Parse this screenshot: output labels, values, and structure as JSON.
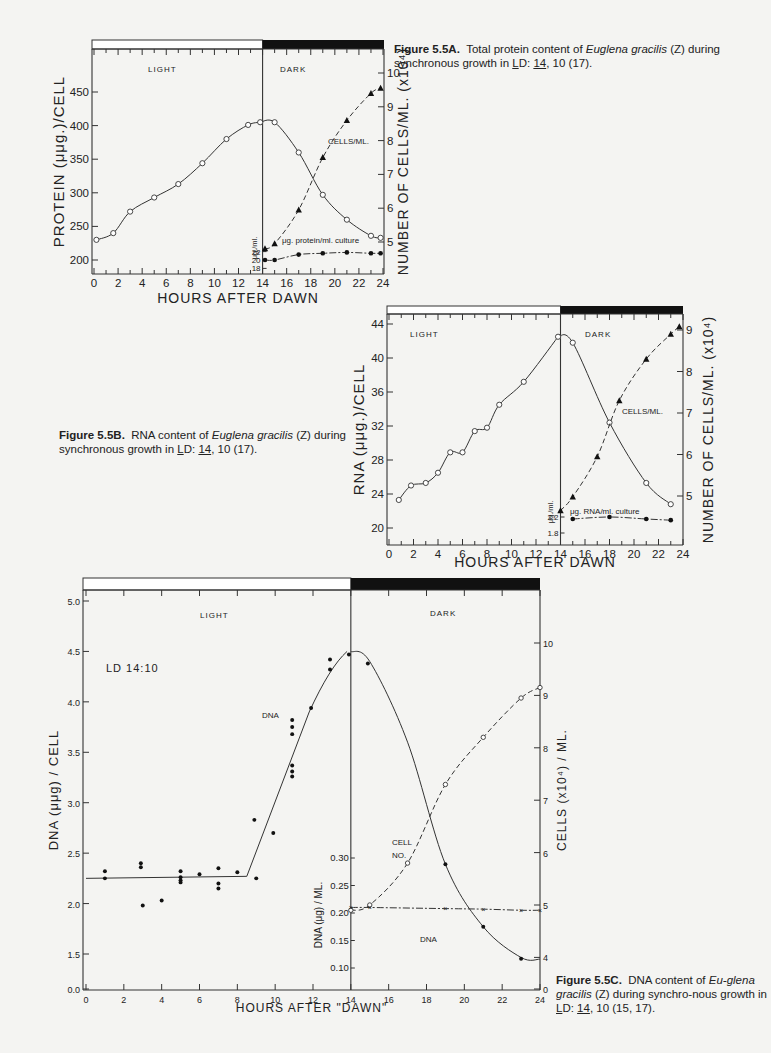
{
  "figures": {
    "a": {
      "caption_label": "Figure 5.5A.",
      "caption_pre": "Total protein content of ",
      "caption_species": "Euglena gracilis",
      "caption_post_1": " (Z) during synchronous growth in ",
      "caption_L": "L",
      "caption_D": "D: ",
      "caption_14": "14",
      "caption_post_2": ", 10 (17)."
    },
    "b": {
      "caption_label": "Figure 5.5B.",
      "caption_pre": "RNA content of ",
      "caption_species": "Euglena gracilis",
      "caption_post_1": " (Z) during synchronous growth in ",
      "caption_L": "L",
      "caption_D": "D: ",
      "caption_14": "14",
      "caption_post_2": ", 10 (17)."
    },
    "c": {
      "caption_label": "Figure 5.5C.",
      "caption_pre": "DNA content of ",
      "caption_species": "Eu-glena gracilis",
      "caption_post_1": " (Z) during synchro-nous growth in ",
      "caption_L": "L",
      "caption_D": "D: ",
      "caption_14": "14",
      "caption_post_2": ", 10 (15, 17)."
    }
  },
  "chart_data": [
    {
      "id": "5.5A",
      "type": "line",
      "title": "Total protein content of Euglena gracilis (Z)",
      "xlabel": "HOURS AFTER DAWN",
      "ylabel": "PROTEIN (μμg.)/CELL",
      "ylabel_right": "NUMBER OF CELLS/ML. (x10⁴)",
      "inset_ylabel": "μg./ml.",
      "xlim": [
        0,
        24
      ],
      "ylim": [
        200,
        500
      ],
      "ylim_right": [
        4,
        10
      ],
      "x_ticks": [
        0,
        2,
        4,
        6,
        8,
        10,
        12,
        14,
        16,
        18,
        20,
        22,
        24
      ],
      "y_ticks": [
        200,
        250,
        300,
        350,
        400,
        450
      ],
      "y_ticks_right": [
        5,
        6,
        7,
        8,
        9,
        10
      ],
      "inset_ticks": [
        18,
        20,
        22
      ],
      "regions": [
        {
          "label": "LIGHT",
          "from": 0,
          "to": 14
        },
        {
          "label": "DARK",
          "from": 14,
          "to": 24
        }
      ],
      "series": [
        {
          "name": "Protein/cell",
          "marker": "open-circle",
          "axis": "left",
          "x": [
            0.2,
            1.6,
            3,
            5,
            7,
            9,
            11,
            12.8,
            13.8,
            15,
            17,
            19,
            21,
            23,
            23.8
          ],
          "y": [
            230,
            240,
            272,
            293,
            313,
            344,
            380,
            401,
            405,
            405,
            360,
            297,
            260,
            236,
            233
          ]
        },
        {
          "name": "CELLS/ML.",
          "marker": "filled-triangle",
          "axis": "right",
          "style": "dashed",
          "x": [
            14.2,
            15,
            17,
            19,
            21,
            23,
            23.8
          ],
          "y": [
            4.8,
            4.95,
            5.95,
            7.5,
            8.6,
            9.4,
            9.55
          ]
        },
        {
          "name": "μg. protein/ml. culture",
          "marker": "filled-circle",
          "axis": "inset",
          "style": "dash-dot",
          "x": [
            14.2,
            15,
            17,
            19,
            21,
            23,
            23.8
          ],
          "y": [
            20,
            20,
            21.3,
            21.6,
            21.8,
            21.6,
            21.6
          ]
        }
      ]
    },
    {
      "id": "5.5B",
      "type": "line",
      "title": "RNA content of Euglena gracilis (Z)",
      "xlabel": "HOURS AFTER DAWN",
      "ylabel": "RNA (μμg.)/CELL",
      "ylabel_right": "NUMBER OF CELLS/ML. (x10⁴)",
      "inset_ylabel": "μg./ml.",
      "xlim": [
        0,
        24
      ],
      "ylim": [
        19,
        45
      ],
      "ylim_right": [
        4,
        9.3
      ],
      "x_ticks": [
        0,
        2,
        4,
        6,
        8,
        10,
        12,
        14,
        16,
        18,
        20,
        22,
        24
      ],
      "y_ticks": [
        20,
        24,
        28,
        32,
        36,
        40,
        44
      ],
      "y_ticks_right": [
        5,
        6,
        7,
        8,
        9
      ],
      "inset_ticks": [
        1.8,
        2.2
      ],
      "regions": [
        {
          "label": "LIGHT",
          "from": 0,
          "to": 14
        },
        {
          "label": "DARK",
          "from": 14,
          "to": 24
        }
      ],
      "series": [
        {
          "name": "RNA/cell",
          "marker": "open-circle",
          "axis": "left",
          "x": [
            0.8,
            1.8,
            3,
            4,
            5,
            6,
            7,
            8,
            9,
            11,
            13.8,
            15,
            18,
            21,
            23
          ],
          "y": [
            23.3,
            25,
            25.3,
            26.5,
            28.9,
            28.9,
            31.4,
            31.8,
            34.5,
            37.2,
            42.5,
            41.8,
            32.4,
            25.3,
            22.8
          ]
        },
        {
          "name": "CELLS/ML.",
          "marker": "filled-triangle",
          "axis": "right",
          "style": "dashed",
          "x": [
            14,
            15,
            17,
            18.8,
            21,
            23,
            23.7
          ],
          "y": [
            4.65,
            4.98,
            5.95,
            7.3,
            8.3,
            8.9,
            9.08
          ]
        },
        {
          "name": "μg. RNA/ml. culture",
          "marker": "filled-circle",
          "axis": "inset",
          "style": "dash-dot",
          "x": [
            15,
            18,
            21,
            23
          ],
          "y": [
            2.15,
            2.2,
            2.15,
            2.12
          ]
        }
      ]
    },
    {
      "id": "5.5C",
      "type": "scatter",
      "title": "DNA content of Euglena gracilis (Z)",
      "xlabel": "HOURS   AFTER   \"DAWN\"",
      "ylabel": "DNA (μμg) / CELL",
      "ylabel_right": "CELLS (x10⁴) / ML.",
      "inset_ylabel": "DNA (μg) / ML.",
      "annotation": "LD 14:10",
      "xlim": [
        0,
        24
      ],
      "ylim": [
        0,
        5.1
      ],
      "ylim_right": [
        3,
        10.5
      ],
      "x_ticks": [
        0,
        2,
        4,
        6,
        8,
        10,
        12,
        14,
        16,
        18,
        20,
        22,
        24
      ],
      "y_ticks": [
        0.0,
        1.5,
        2.0,
        2.5,
        3.0,
        3.5,
        4.0,
        4.5,
        5.0
      ],
      "y_ticks_right": [
        0,
        4,
        5,
        6,
        7,
        8,
        9,
        10
      ],
      "inset_ticks": [
        0.1,
        0.15,
        0.2,
        0.25,
        0.3
      ],
      "regions": [
        {
          "label": "LIGHT",
          "from": 0,
          "to": 14
        },
        {
          "label": "DARK",
          "from": 14,
          "to": 24
        }
      ],
      "series": [
        {
          "name": "DNA",
          "marker": "filled-circle",
          "axis": "left",
          "x": [
            1,
            1,
            2.9,
            2.9,
            3,
            4,
            5,
            5,
            5,
            5,
            6,
            7,
            7,
            7,
            8,
            8.9,
            9,
            9.9,
            10.9,
            10.9,
            10.9,
            10.9,
            10.9,
            10.9,
            11.9,
            12.9,
            12.9,
            13.9,
            14.9,
            19,
            21,
            23
          ],
          "y": [
            2.32,
            2.25,
            2.4,
            2.36,
            1.98,
            2.03,
            2.32,
            2.26,
            2.23,
            2.21,
            2.29,
            2.35,
            2.2,
            2.15,
            2.31,
            2.83,
            2.25,
            2.7,
            3.82,
            3.75,
            3.68,
            3.37,
            3.31,
            3.26,
            3.94,
            4.42,
            4.32,
            4.47,
            4.38,
            2.39,
            1.77,
            1.3
          ]
        },
        {
          "name": "CELL NO.",
          "marker": "open-circle",
          "axis": "right",
          "style": "dashed",
          "x": [
            14,
            15,
            17,
            19,
            21,
            23,
            24
          ],
          "y": [
            4.9,
            5.0,
            5.8,
            7.3,
            8.2,
            8.95,
            9.15
          ]
        },
        {
          "name": "DNA (μg)/ML.",
          "marker": "x",
          "axis": "inset",
          "style": "dash-dot",
          "x": [
            14,
            15,
            19,
            21,
            23,
            24
          ],
          "y": [
            0.21,
            0.21,
            0.208,
            0.207,
            0.205,
            0.205
          ]
        }
      ]
    }
  ]
}
